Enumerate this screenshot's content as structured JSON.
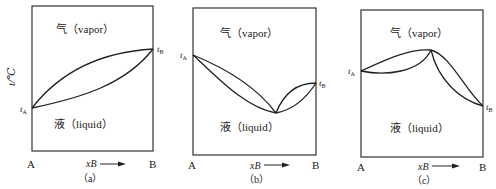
{
  "y_axis_label": "t/℃",
  "panels": [
    {
      "id": "a",
      "caption": "（a）",
      "vapor_label": "气（vapor）",
      "liquid_label": "液（liquid）",
      "left_end": "A",
      "right_end": "B",
      "x_axis": "xB",
      "x_axis_sub": "B",
      "t_left": "t",
      "t_left_sub": "A",
      "t_right": "t",
      "t_right_sub": "B",
      "type": "ideal (no azeotrope)"
    },
    {
      "id": "b",
      "caption": "（b）",
      "vapor_label": "气（vapor）",
      "liquid_label": "液（liquid）",
      "left_end": "A",
      "right_end": "B",
      "x_axis": "xB",
      "x_axis_sub": "B",
      "t_left": "t",
      "t_left_sub": "A",
      "t_right": "t",
      "t_right_sub": "B",
      "type": "minimum-boiling azeotrope"
    },
    {
      "id": "c",
      "caption": "（c）",
      "vapor_label": "气（vapor）",
      "liquid_label": "液（liquid）",
      "left_end": "A",
      "right_end": "B",
      "x_axis": "xB",
      "x_axis_sub": "B",
      "t_left": "t",
      "t_left_sub": "A",
      "t_right": "t",
      "t_right_sub": "B",
      "type": "maximum-boiling azeotrope"
    }
  ]
}
